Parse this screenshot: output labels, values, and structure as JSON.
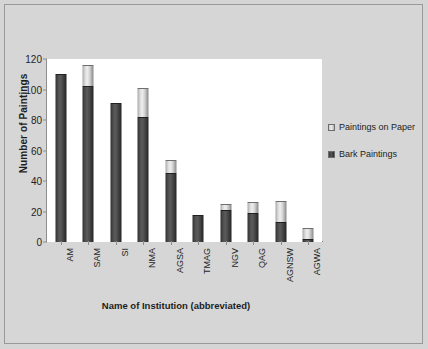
{
  "chart_data": {
    "type": "bar",
    "subtype": "stacked-column",
    "title": "",
    "xlabel": "Name of Institution (abbreviated)",
    "ylabel": "Number of Paintings",
    "categories": [
      "AM",
      "SAM",
      "SI",
      "NMA",
      "AGSA",
      "TMAG",
      "NGV",
      "QAG",
      "AGNSW",
      "AGWA"
    ],
    "series": [
      {
        "name": "Bark Paintings",
        "color": "#3f3f3f",
        "values": [
          110,
          102,
          91,
          82,
          45,
          18,
          21,
          19,
          13,
          2
        ]
      },
      {
        "name": "Paintings on Paper",
        "color": "#d8d8d8",
        "values": [
          0,
          14,
          0,
          19,
          9,
          0,
          4,
          7,
          14,
          7
        ]
      }
    ],
    "totals": [
      110,
      116,
      91,
      101,
      54,
      18,
      25,
      26,
      27,
      9
    ],
    "ylim": [
      0,
      120
    ],
    "yticks": [
      0,
      20,
      40,
      60,
      80,
      100,
      120
    ],
    "ytick_labels": [
      "0",
      "20",
      "40",
      "60",
      "80",
      "100",
      "120"
    ],
    "grid": false,
    "legend_position": "right",
    "legend": [
      {
        "label": "Paintings on Paper",
        "swatch": "light"
      },
      {
        "label": "Bark Paintings",
        "swatch": "dark"
      }
    ]
  }
}
